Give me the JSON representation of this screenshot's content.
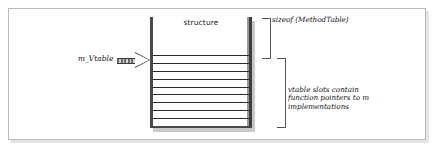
{
  "figure": {
    "name": "vtable-structure-diagram",
    "background_color": "#ffffff",
    "frame_border_color": "#b9b9b9"
  },
  "structure": {
    "header_label": "structure",
    "slot_count": 9,
    "rail_color": "#4a4a4a",
    "slot_line_color": "#2b2b2b"
  },
  "pointer": {
    "label": "m_Vtable",
    "arrow_icon": "block-arrow-right-icon",
    "arrow_color": "#6e6e6e"
  },
  "annotations": {
    "sizeof_label": "sizeof (MethodTable)",
    "slots_caption_line1": "vtable slots contain",
    "slots_caption_line2": "function pointers to m",
    "slots_caption_line3": "implementations"
  }
}
